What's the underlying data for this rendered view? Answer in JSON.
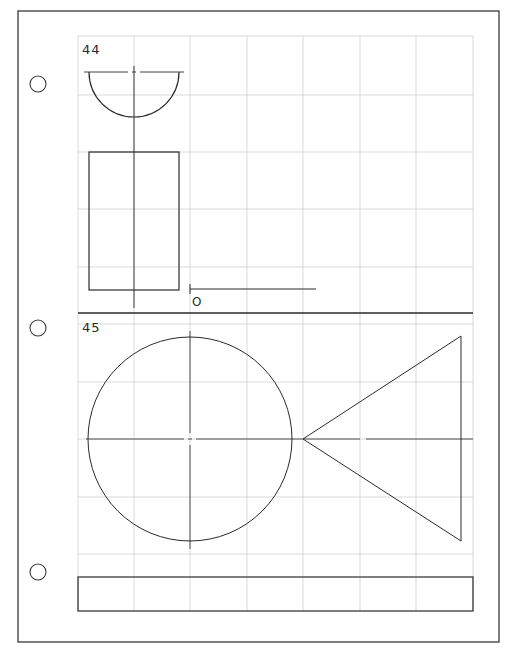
{
  "sheet": {
    "background": "#ffffff",
    "border_color": "#3a3a3a",
    "grid_color": "#cfcfcf",
    "line_color": "#2a2a2a",
    "border": {
      "x": 18,
      "y": 11,
      "w": 481,
      "h": 631
    },
    "punch_holes": [
      {
        "cx": 38,
        "cy": 84,
        "r": 8
      },
      {
        "cx": 38,
        "cy": 328,
        "r": 8
      },
      {
        "cx": 38,
        "cy": 572,
        "r": 8
      }
    ],
    "grid": {
      "x": [
        78,
        134,
        190,
        247,
        303,
        360,
        416,
        473
      ],
      "y_top": [
        36,
        95,
        152,
        209,
        267
      ],
      "y_bottom": [
        324,
        382,
        439,
        497,
        554
      ],
      "top": 36,
      "bottom": 577,
      "left": 78,
      "right": 473
    },
    "separator": {
      "y": 313,
      "x1": 78,
      "x2": 473
    }
  },
  "exercise_44": {
    "label": "44",
    "label_pos": {
      "x": 82,
      "y": 54
    },
    "semicircle": {
      "cx": 134,
      "cy": 72,
      "r": 45
    },
    "centerline_h": {
      "x1": 84,
      "x2": 184,
      "y": 72
    },
    "rectangle": {
      "x": 89,
      "y": 152,
      "w": 90,
      "h": 138
    },
    "centerline_v": {
      "x": 134,
      "y1": 66,
      "y2": 308
    },
    "baseline": {
      "x1": 190,
      "x2": 316,
      "y": 289,
      "tick_y1": 284,
      "tick_y2": 294
    },
    "origin_label": "O",
    "origin_label_pos": {
      "x": 192,
      "y": 306
    }
  },
  "exercise_45": {
    "label": "45",
    "label_pos": {
      "x": 82,
      "y": 332
    },
    "circle": {
      "cx": 190,
      "cy": 439,
      "r": 102
    },
    "centerline_h": {
      "x1": 86,
      "x2": 473,
      "y": 439
    },
    "centerline_v": {
      "x": 190,
      "y1": 331,
      "y2": 549
    },
    "triangle": {
      "points": "303,439 461,336 461,541"
    }
  },
  "title_block": {
    "x": 78,
    "y": 577,
    "w": 395,
    "h": 34
  }
}
